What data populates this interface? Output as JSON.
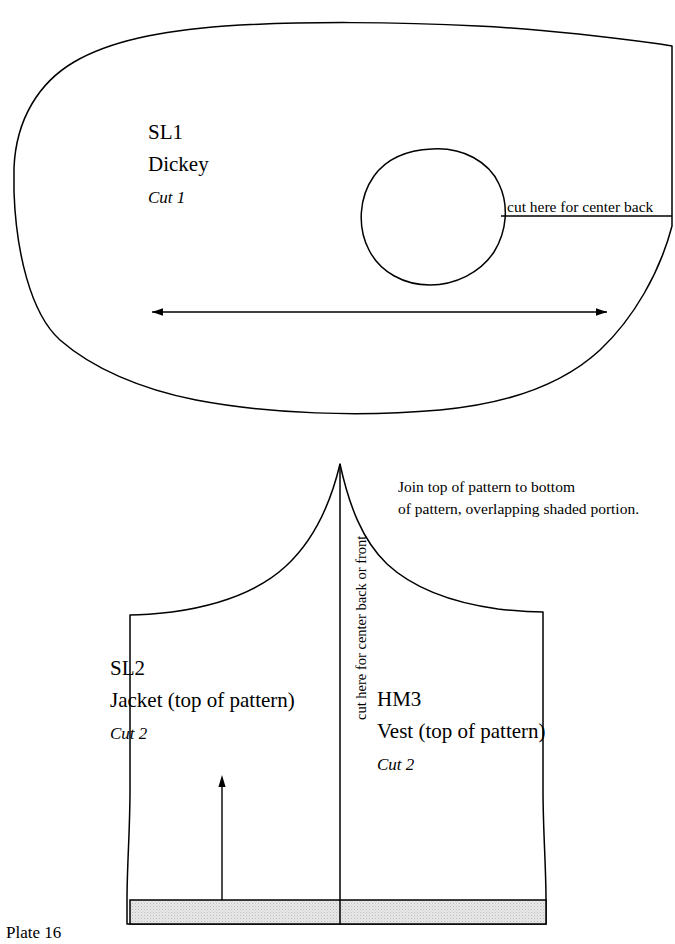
{
  "plate": {
    "caption": "Plate 16"
  },
  "pieces": {
    "dickey": {
      "code": "SL1",
      "name": "Dickey",
      "cut": "Cut 1",
      "cut_line_label": "cut here for center back"
    },
    "jacket": {
      "code": "SL2",
      "name": "Jacket (top of pattern)",
      "cut": "Cut 2"
    },
    "vest": {
      "code": "HM3",
      "name": "Vest (top of pattern)",
      "cut": "Cut 2"
    }
  },
  "annotations": {
    "center_line_label": "cut here for center back or front",
    "join_note_line1": "Join top of pattern to bottom",
    "join_note_line2": "of pattern, overlapping shaded portion."
  },
  "colors": {
    "ink": "#000000",
    "paper": "#ffffff",
    "shade_fill": "#e3e3e3"
  }
}
